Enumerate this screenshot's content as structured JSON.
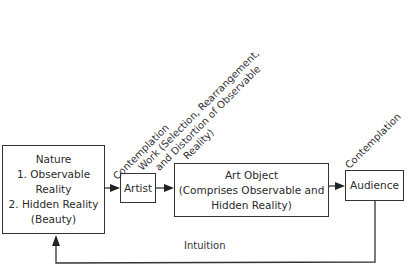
{
  "diagram": {
    "nodes": {
      "nature": {
        "title": "Nature",
        "line1": "1. Observable",
        "line2": "Reality",
        "line3": "2. Hidden Reality",
        "line4": "(Beauty)"
      },
      "artist": {
        "label": "Artist"
      },
      "art_object": {
        "line1": "Art Object",
        "line2": "(Comprises Observable and",
        "line3": "Hidden Reality)"
      },
      "audience": {
        "label": "Audience"
      }
    },
    "edges": {
      "nature_to_artist": {
        "label": "Contemplation"
      },
      "artist_to_art_object": {
        "line1": "Work (Selection, Rearrangement,",
        "line2": "and Distortion of Observable",
        "line3": "Reality)"
      },
      "art_object_to_audience": {
        "label": "Contemplation"
      },
      "audience_to_nature": {
        "label": "Intuition"
      }
    }
  }
}
